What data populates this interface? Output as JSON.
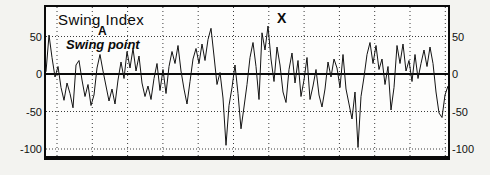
{
  "chart_data": {
    "type": "line",
    "title": "Swing Index",
    "ylabel": "",
    "xlabel": "",
    "ylim": [
      -109,
      89
    ],
    "y_ticks": [
      50,
      0,
      -50,
      -100
    ],
    "y_ticks_left": [
      "50",
      "0",
      "-50",
      "-100"
    ],
    "y_ticks_right": [
      "50",
      "0",
      "-50",
      "-100"
    ],
    "grid": "dotted horizontal at 50/-50/-100, dotted vertical columns, solid zero line",
    "x_gridline_count": 12,
    "legend": "none",
    "line_color": "#141414",
    "zero_line_value": 0,
    "annotations": [
      {
        "id": "point-a",
        "text": "A"
      },
      {
        "id": "swing-point-label",
        "text": "Swing point"
      },
      {
        "id": "point-x",
        "text": "X"
      }
    ],
    "values": [
      3,
      52,
      22,
      -4,
      10,
      -18,
      -35,
      -12,
      -26,
      -45,
      12,
      18,
      -8,
      -30,
      -14,
      -42,
      -28,
      8,
      26,
      4,
      -16,
      -36,
      -20,
      -40,
      -8,
      16,
      -6,
      30,
      8,
      34,
      4,
      24,
      -12,
      -30,
      -16,
      -34,
      -6,
      14,
      -22,
      6,
      -26,
      10,
      30,
      14,
      38,
      4,
      -20,
      -40,
      -10,
      20,
      34,
      14,
      40,
      18,
      46,
      61,
      24,
      -14,
      2,
      -32,
      -95,
      -42,
      -18,
      12,
      -26,
      -73,
      -44,
      -14,
      22,
      42,
      10,
      -34,
      55,
      32,
      64,
      20,
      -10,
      36,
      12,
      -24,
      -38,
      6,
      28,
      -12,
      18,
      -30,
      -8,
      22,
      -34,
      -16,
      6,
      -28,
      -44,
      -20,
      16,
      -4,
      20,
      8,
      -18,
      26,
      -20,
      -40,
      -60,
      -24,
      -98,
      -30,
      -4,
      26,
      42,
      14,
      38,
      6,
      20,
      -14,
      10,
      -48,
      -18,
      38,
      14,
      40,
      4,
      18,
      -10,
      26,
      -6,
      14,
      32,
      10,
      36,
      14,
      -24,
      -52,
      -58,
      -28,
      -16
    ]
  }
}
